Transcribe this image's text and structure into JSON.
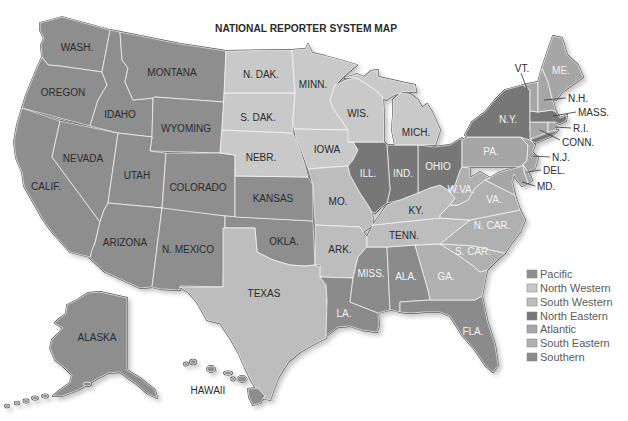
{
  "title": "NATIONAL REPORTER SYSTEM MAP",
  "regions": {
    "pacific": {
      "label": "Pacific",
      "color": "#8e8e8e"
    },
    "north_western": {
      "label": "North Western",
      "color": "#c9c9c9"
    },
    "south_western": {
      "label": "South Western",
      "color": "#bdbdbd"
    },
    "north_eastern": {
      "label": "North Eastern",
      "color": "#777777"
    },
    "atlantic": {
      "label": "Atlantic",
      "color": "#a6a6a6"
    },
    "south_eastern": {
      "label": "South Eastern",
      "color": "#b0b0b0"
    },
    "southern": {
      "label": "Southern",
      "color": "#8b8b8b"
    }
  },
  "states": {
    "WA": {
      "label": "WASH.",
      "region": "pacific"
    },
    "OR": {
      "label": "OREGON",
      "region": "pacific"
    },
    "CA": {
      "label": "CALIF.",
      "region": "pacific"
    },
    "NV": {
      "label": "NEVADA",
      "region": "pacific"
    },
    "ID": {
      "label": "IDAHO",
      "region": "pacific"
    },
    "MT": {
      "label": "MONTANA",
      "region": "pacific"
    },
    "WY": {
      "label": "WYOMING",
      "region": "pacific"
    },
    "UT": {
      "label": "UTAH",
      "region": "pacific"
    },
    "CO": {
      "label": "COLORADO",
      "region": "pacific"
    },
    "AZ": {
      "label": "ARIZONA",
      "region": "pacific"
    },
    "NM": {
      "label": "N. MEXICO",
      "region": "pacific"
    },
    "KS": {
      "label": "KANSAS",
      "region": "pacific"
    },
    "OK": {
      "label": "OKLA.",
      "region": "pacific"
    },
    "AK": {
      "label": "ALASKA",
      "region": "pacific"
    },
    "HI": {
      "label": "HAWAII",
      "region": "pacific"
    },
    "ND": {
      "label": "N. DAK.",
      "region": "north_western"
    },
    "SD": {
      "label": "S. DAK.",
      "region": "north_western"
    },
    "NE": {
      "label": "NEBR.",
      "region": "north_western"
    },
    "MN": {
      "label": "MINN.",
      "region": "north_western"
    },
    "IA": {
      "label": "IOWA",
      "region": "north_western"
    },
    "WI": {
      "label": "WIS.",
      "region": "north_western"
    },
    "MI": {
      "label": "MICH.",
      "region": "north_western"
    },
    "MO": {
      "label": "MO.",
      "region": "south_western"
    },
    "AR": {
      "label": "ARK.",
      "region": "south_western"
    },
    "TX": {
      "label": "TEXAS",
      "region": "south_western"
    },
    "KY": {
      "label": "KY.",
      "region": "south_western"
    },
    "TN": {
      "label": "TENN.",
      "region": "south_western"
    },
    "NY": {
      "label": "N.Y.",
      "region": "north_eastern"
    },
    "MA": {
      "label": "MASS.",
      "region": "north_eastern"
    },
    "IL": {
      "label": "ILL.",
      "region": "north_eastern"
    },
    "IN": {
      "label": "IND.",
      "region": "north_eastern"
    },
    "OH": {
      "label": "OHIO",
      "region": "north_eastern"
    },
    "ME": {
      "label": "ME.",
      "region": "atlantic"
    },
    "NH": {
      "label": "N.H.",
      "region": "atlantic"
    },
    "VT": {
      "label": "VT.",
      "region": "atlantic"
    },
    "CT": {
      "label": "CONN.",
      "region": "atlantic"
    },
    "RI": {
      "label": "R.I.",
      "region": "atlantic"
    },
    "PA": {
      "label": "PA.",
      "region": "atlantic"
    },
    "NJ": {
      "label": "N.J.",
      "region": "atlantic"
    },
    "DE": {
      "label": "DEL.",
      "region": "atlantic"
    },
    "MD": {
      "label": "MD.",
      "region": "atlantic"
    },
    "VA": {
      "label": "VA.",
      "region": "south_eastern"
    },
    "WV": {
      "label": "W.VA.",
      "region": "south_eastern"
    },
    "NC": {
      "label": "N. CAR.",
      "region": "south_eastern"
    },
    "SC": {
      "label": "S. CAR.",
      "region": "south_eastern"
    },
    "GA": {
      "label": "GA.",
      "region": "south_eastern"
    },
    "MS": {
      "label": "MISS.",
      "region": "southern"
    },
    "AL": {
      "label": "ALA.",
      "region": "southern"
    },
    "LA": {
      "label": "LA.",
      "region": "southern"
    },
    "FL": {
      "label": "FLA.",
      "region": "southern"
    }
  }
}
